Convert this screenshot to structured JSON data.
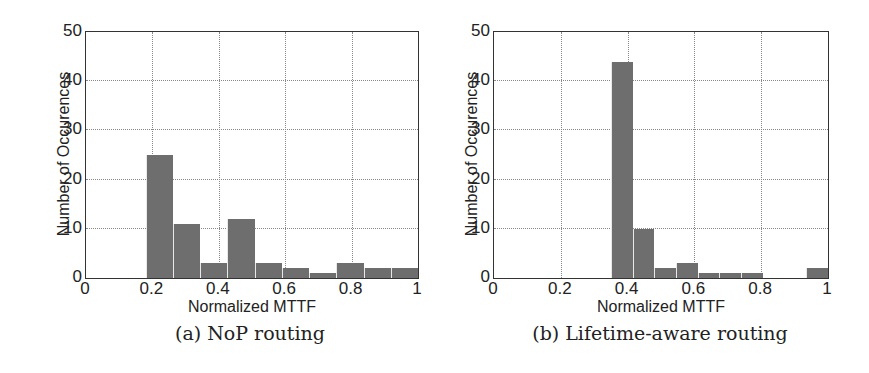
{
  "chart_data": [
    {
      "type": "bar",
      "title": "",
      "caption": "(a) NoP routing",
      "xlabel": "Normalized MTTF",
      "ylabel": "Number of Occurences",
      "xlim": [
        0,
        1
      ],
      "ylim": [
        0,
        50
      ],
      "xticks": [
        "0",
        "0.2",
        "0.4",
        "0.6",
        "0.8",
        "1"
      ],
      "yticks": [
        "0",
        "10",
        "20",
        "30",
        "40",
        "50"
      ],
      "grid": true,
      "bin_start": 0.18,
      "bin_width": 0.082,
      "bin_centers": [
        0.221,
        0.303,
        0.385,
        0.467,
        0.549,
        0.631,
        0.713,
        0.795,
        0.877,
        0.959
      ],
      "values": [
        25,
        11,
        3,
        12,
        3,
        2,
        1,
        3,
        2,
        2
      ]
    },
    {
      "type": "bar",
      "title": "",
      "caption": "(b) Lifetime-aware routing",
      "xlabel": "Normalized MTTF",
      "ylabel": "Number of Occurences",
      "xlim": [
        0,
        1
      ],
      "ylim": [
        0,
        50
      ],
      "xticks": [
        "0",
        "0.2",
        "0.4",
        "0.6",
        "0.8",
        "1"
      ],
      "yticks": [
        "0",
        "10",
        "20",
        "30",
        "40",
        "50"
      ],
      "grid": true,
      "bin_start": 0.35,
      "bin_width": 0.065,
      "bin_centers": [
        0.3825,
        0.4475,
        0.5125,
        0.5775,
        0.6425,
        0.7075,
        0.7725,
        0.8375,
        0.9025,
        0.9675
      ],
      "values": [
        44,
        10,
        2,
        3,
        1,
        1,
        1,
        0,
        0,
        2
      ]
    }
  ],
  "colors": {
    "bar": "#6e6e6e",
    "axis": "#333333",
    "grid": "#888888"
  }
}
